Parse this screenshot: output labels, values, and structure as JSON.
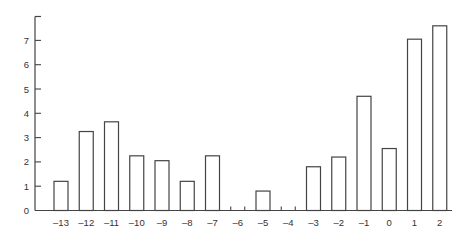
{
  "chart_data": {
    "type": "bar",
    "title": "",
    "xlabel": "",
    "ylabel": "",
    "categories": [
      "–13",
      "–12",
      "–11",
      "–10",
      "–9",
      "–8",
      "–7",
      "–6",
      "–5",
      "–4",
      "–3",
      "–2",
      "–1",
      "0",
      "1",
      "2"
    ],
    "x": [
      -13,
      -12,
      -11,
      -10,
      -9,
      -8,
      -7,
      -6,
      -5,
      -4,
      -3,
      -2,
      -1,
      0,
      1,
      2
    ],
    "values": [
      1.2,
      3.25,
      3.65,
      2.25,
      2.05,
      1.2,
      2.25,
      0,
      0.8,
      0,
      1.8,
      2.2,
      4.7,
      2.55,
      7.05,
      7.6
    ],
    "yticks": [
      "0",
      "1",
      "2",
      "3",
      "4",
      "5",
      "6",
      "7"
    ],
    "ylim": [
      0,
      8
    ],
    "grid": false,
    "legend": null,
    "bar_fill": "#ffffff",
    "bar_stroke": "#444444"
  }
}
